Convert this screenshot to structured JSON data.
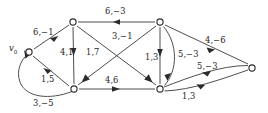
{
  "figure": {
    "type": "directed-graph",
    "background_color": "#ffffff",
    "line_color": "#3a3a3a",
    "text_color": "#1d1d1d"
  },
  "nodes": [
    {
      "id": "v0",
      "label": "v",
      "subscript": "0",
      "x": 29,
      "y": 52,
      "label_x": 9,
      "label_y": 44
    },
    {
      "id": "a",
      "label": "",
      "subscript": "",
      "x": 73,
      "y": 22
    },
    {
      "id": "b",
      "label": "",
      "subscript": "",
      "x": 160,
      "y": 22
    },
    {
      "id": "c",
      "label": "",
      "subscript": "",
      "x": 74,
      "y": 89
    },
    {
      "id": "d",
      "label": "",
      "subscript": "",
      "x": 160,
      "y": 89
    },
    {
      "id": "e",
      "label": "",
      "subscript": "",
      "x": 252,
      "y": 68
    }
  ],
  "edges": [
    {
      "id": "e1",
      "from": "a",
      "to": "v0",
      "label": "6,−1",
      "label_x": 33,
      "label_y": 28
    },
    {
      "id": "e2",
      "from": "b",
      "to": "a",
      "label": "6,−3",
      "label_x": 105,
      "label_y": 7
    },
    {
      "id": "e3",
      "from": "a",
      "to": "c",
      "label": "4,1",
      "label_x": 60,
      "label_y": 48
    },
    {
      "id": "e4",
      "from": "a",
      "to": "d",
      "label": "1,7",
      "label_x": 86,
      "label_y": 48
    },
    {
      "id": "e5",
      "from": "b",
      "to": "c",
      "label": "3,−1",
      "label_x": 112,
      "label_y": 32
    },
    {
      "id": "e6",
      "from": "b",
      "to": "d",
      "label": "1,3",
      "label_x": 145,
      "label_y": 53
    },
    {
      "id": "e7",
      "from": "b",
      "to": "d",
      "label": "5,−3",
      "label_x": 178,
      "label_y": 50
    },
    {
      "id": "e8",
      "from": "b",
      "to": "e",
      "label": "4,−6",
      "label_x": 205,
      "label_y": 36
    },
    {
      "id": "e9",
      "from": "v0",
      "to": "c",
      "label": "1,5",
      "label_x": 41,
      "label_y": 75
    },
    {
      "id": "e10",
      "from": "c",
      "to": "d",
      "label": "4,6",
      "label_x": 105,
      "label_y": 76
    },
    {
      "id": "e11",
      "from": "e",
      "to": "d",
      "label": "5,−3",
      "label_x": 197,
      "label_y": 62
    },
    {
      "id": "e12",
      "from": "d",
      "to": "e",
      "label": "1,3",
      "label_x": 182,
      "label_y": 92
    },
    {
      "id": "e13",
      "from": "c",
      "to": "v0",
      "label": "3,−5",
      "label_x": 33,
      "label_y": 99
    }
  ]
}
